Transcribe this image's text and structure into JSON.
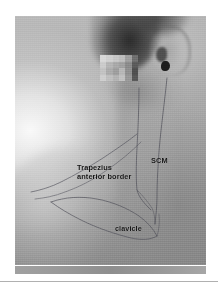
{
  "figure": {
    "kind": "clinical-photograph",
    "alt": "Lateral photograph of a patient's neck and shoulder with surface anatomy drawn in marker pen",
    "privacy_mask": {
      "name": "pixelated-redaction",
      "description": "pixelated block covering the eye region",
      "columns": 6,
      "rows": 4,
      "tiles": [
        "#d8d8d8",
        "#cfcfcf",
        "#c6c6c6",
        "#bdbdbd",
        "#9e9e9e",
        "#6e6e6e",
        "#cbcbcb",
        "#b4b4b4",
        "#a8a8a8",
        "#a0a0a0",
        "#8a8a8a",
        "#5a5a5a",
        "#c2c2c2",
        "#ababab",
        "#9d9d9d",
        "#b6b6b6",
        "#8f8f8f",
        "#4e4e4e",
        "#cdcdcd",
        "#bebebe",
        "#b2b2b2",
        "#c0c0c0",
        "#979797",
        "#565656"
      ]
    }
  },
  "labels": {
    "trapezius_line1": "Trapezius",
    "trapezius_line2": "anterior border",
    "scm": "SCM",
    "clavicle": "clavicle"
  },
  "markings": {
    "scm_anterior_border": "sternocleidomastoid anterior border line",
    "scm_posterior_border": "sternocleidomastoid posterior border line",
    "trapezius_anterior_border": "trapezius anterior border line",
    "clavicle_outline": "clavicle outline"
  },
  "colors": {
    "page_background": "#ffffff",
    "label_text": "#141414",
    "marker_ink": "#4a4a52",
    "footer_band": "#8e8e8e",
    "footer_rule": "#b0b0b0"
  }
}
